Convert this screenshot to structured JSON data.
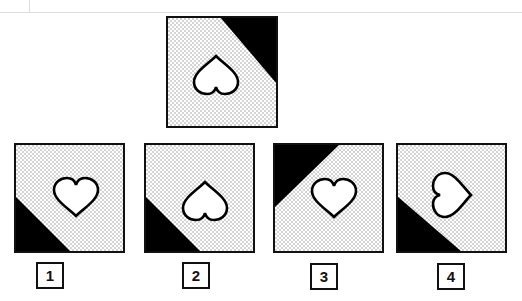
{
  "puzzle": {
    "question_figure": {
      "shape": "heart",
      "heart_orientation": "inverted (point up)",
      "black_corner": "top-right"
    },
    "options": [
      {
        "label": "1",
        "heart_orientation": "upright",
        "black_corner": "bottom-left"
      },
      {
        "label": "2",
        "heart_orientation": "inverted (point up)",
        "black_corner": "bottom-left"
      },
      {
        "label": "3",
        "heart_orientation": "upright",
        "black_corner": "top-left"
      },
      {
        "label": "4",
        "heart_orientation": "rotated (point right)",
        "black_corner": "bottom-left"
      }
    ]
  },
  "colors": {
    "frame_border": "#111111",
    "fill_black": "#000000",
    "dot_fill": "#d9d9d9",
    "background": "#ffffff"
  }
}
